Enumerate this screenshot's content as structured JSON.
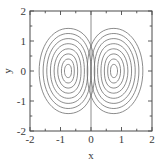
{
  "chart_data": {
    "type": "line",
    "title": "",
    "subtitle": "",
    "xlabel": "x",
    "ylabel": "y",
    "xlim": [
      -2,
      2
    ],
    "ylim": [
      -2,
      2
    ],
    "grid": false,
    "legend": null,
    "legend_position": "none",
    "xticks": [
      -2,
      -1,
      0,
      1,
      2
    ],
    "xtick_labels": [
      "-2",
      "-1",
      "0",
      "1",
      "2"
    ],
    "yticks": [
      -2,
      -1,
      0,
      1,
      2
    ],
    "ytick_labels": [
      "-2",
      "-1",
      "0",
      "1",
      "2"
    ],
    "x_minor_ticks": [
      -1.5,
      -0.5,
      0.5,
      1.5
    ],
    "y_minor_ticks": [
      -1.5,
      -0.5,
      0.5,
      1.5
    ],
    "plot_description": "Contour plot of a symmetric double-lobe (dipole / double-gyre) streamfunction. Two mirror-image families of nested closed contours are centred near (-0.75, 0) and (0.75, 0), separated by a straight vertical separatrix contour along x = 0 spanning the full height of the frame.",
    "line_color": "#6e6e6e",
    "line_width": 0.8,
    "background_color": "#ffffff",
    "frame_color": "#4a4a4a",
    "series": [
      {
        "name": "separatrix",
        "kind": "vertical-line",
        "x": 0,
        "y_range": [
          -2,
          2
        ]
      },
      {
        "name": "left-lobe-contours",
        "kind": "nested-closed-contours",
        "center": [
          -0.75,
          0
        ],
        "levels": [
          -0.08,
          -0.16,
          -0.26,
          -0.38,
          -0.52,
          -0.68,
          -0.86,
          -1.02
        ],
        "half_widths": [
          0.95,
          0.82,
          0.7,
          0.58,
          0.46,
          0.34,
          0.22,
          0.12
        ],
        "half_heights": [
          1.42,
          1.25,
          1.08,
          0.91,
          0.74,
          0.57,
          0.4,
          0.22
        ]
      },
      {
        "name": "right-lobe-contours",
        "kind": "nested-closed-contours",
        "center": [
          0.75,
          0
        ],
        "levels": [
          0.08,
          0.16,
          0.26,
          0.38,
          0.52,
          0.68,
          0.86,
          1.02
        ],
        "half_widths": [
          0.95,
          0.82,
          0.7,
          0.58,
          0.46,
          0.34,
          0.22,
          0.12
        ],
        "half_heights": [
          1.42,
          1.25,
          1.08,
          0.91,
          0.74,
          0.57,
          0.4,
          0.22
        ]
      }
    ]
  },
  "axes": {
    "x_title": "x",
    "y_title": "y"
  }
}
